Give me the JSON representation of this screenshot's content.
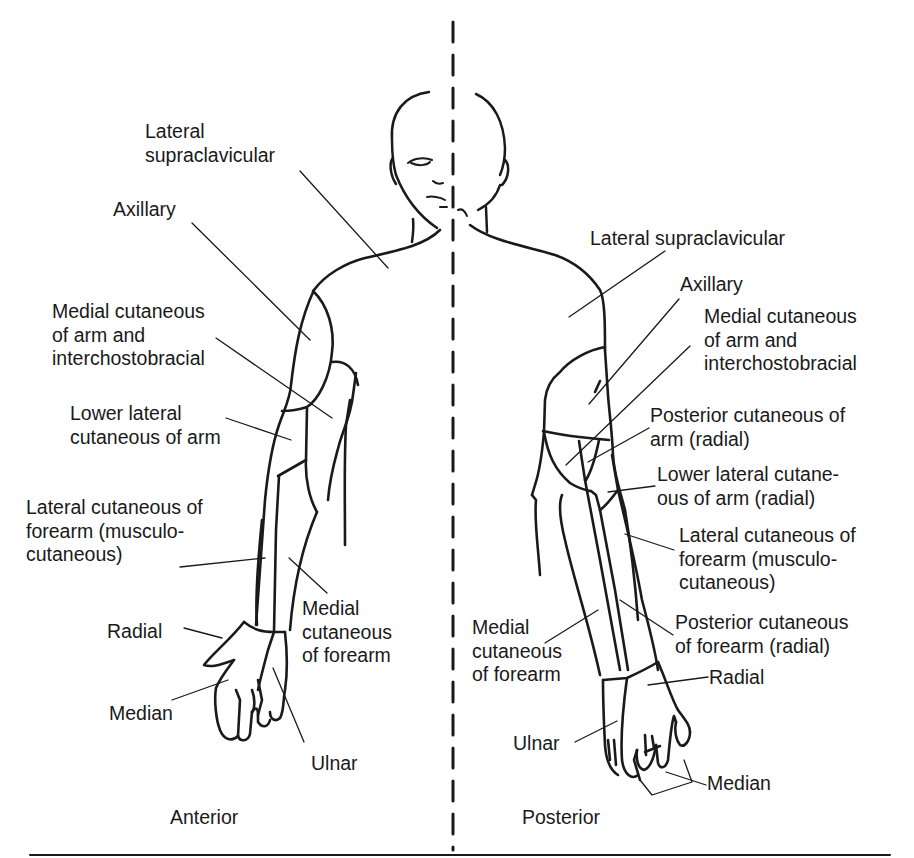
{
  "figure": {
    "type": "dermatome / cutaneous nerve distribution diagram of the upper limb",
    "views": [
      {
        "id": "anterior",
        "label": "Anterior"
      },
      {
        "id": "posterior",
        "label": "Posterior"
      }
    ]
  },
  "anterior_labels": [
    {
      "id": "lat-supraclav",
      "text": "Lateral\nsupraclavicular"
    },
    {
      "id": "axillary",
      "text": "Axillary"
    },
    {
      "id": "med-cut-arm",
      "text": "Medial cutaneous\nof arm and\ninterchostobracial"
    },
    {
      "id": "lower-lat-cut-arm",
      "text": "Lower lateral\ncutaneous of arm"
    },
    {
      "id": "lat-cut-forearm",
      "text": "Lateral cutaneous of\nforearm (musculo-\ncutaneous)"
    },
    {
      "id": "med-cut-forearm",
      "text": "Medial\ncutaneous\nof forearm"
    },
    {
      "id": "radial",
      "text": "Radial"
    },
    {
      "id": "median",
      "text": "Median"
    },
    {
      "id": "ulnar",
      "text": "Ulnar"
    }
  ],
  "posterior_labels": [
    {
      "id": "lat-supraclav",
      "text": "Lateral supraclavicular"
    },
    {
      "id": "axillary",
      "text": "Axillary"
    },
    {
      "id": "med-cut-arm",
      "text": "Medial cutaneous\nof arm and\ninterchostobracial"
    },
    {
      "id": "post-cut-arm",
      "text": "Posterior cutaneous of\narm (radial)"
    },
    {
      "id": "lower-lat-cut-arm",
      "text": "Lower lateral cutane-\nous of arm (radial)"
    },
    {
      "id": "lat-cut-forearm",
      "text": "Lateral cutaneous of\nforearm (musculo-\ncutaneous)"
    },
    {
      "id": "post-cut-forearm",
      "text": "Posterior cutaneous\nof forearm (radial)"
    },
    {
      "id": "med-cut-forearm",
      "text": "Medial\ncutaneous\nof forearm"
    },
    {
      "id": "radial",
      "text": "Radial"
    },
    {
      "id": "ulnar",
      "text": "Ulnar"
    },
    {
      "id": "median",
      "text": "Median"
    }
  ],
  "colors": {
    "ink": "#1a1a1a",
    "background": "#ffffff"
  }
}
